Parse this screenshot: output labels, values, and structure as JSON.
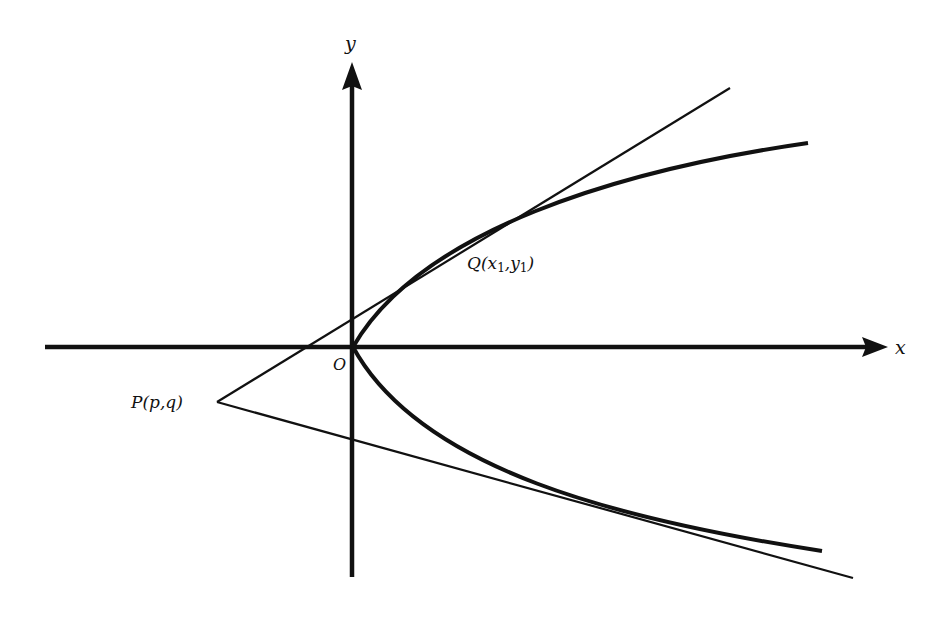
{
  "diagram": {
    "axes": {
      "x_label": "x",
      "y_label": "y",
      "origin_label": "O"
    },
    "points": {
      "Q": {
        "name": "Q",
        "open": "(",
        "x_coord": "x",
        "x_sub": "1",
        "sep": ",",
        "y_coord": "y",
        "y_sub": "1",
        "close": ")"
      },
      "P": {
        "name": "P",
        "coords": "(p,q)"
      }
    },
    "colors": {
      "ink": "#111111",
      "background": "#ffffff"
    }
  }
}
